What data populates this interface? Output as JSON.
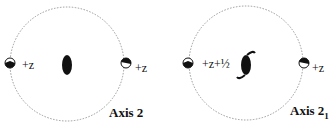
{
  "diagrams": [
    {
      "title": "Axis 2",
      "title_sub": "",
      "left_label": "+z",
      "right_label": "+z",
      "axis_symbol": "two-fold-rotation-axis"
    },
    {
      "title": "Axis 2",
      "title_sub": "1",
      "left_label": "+z+½",
      "right_label": "+z",
      "axis_symbol": "two-fold-screw-axis"
    }
  ],
  "colors": {
    "ink": "#111111",
    "circle": "#999999"
  }
}
